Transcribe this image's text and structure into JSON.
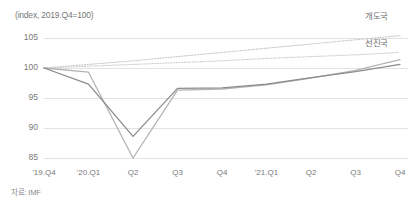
{
  "chart_data": {
    "type": "line",
    "title": "(index, 2019.Q4=100)",
    "xlabel": "",
    "ylabel": "",
    "unit_note": "(index, 2019.Q4=100)",
    "source": "자료: IMF",
    "grid": true,
    "legend_position": "right-inline",
    "ylim": [
      83,
      106.5
    ],
    "yticks": [
      85,
      90,
      95,
      100,
      105
    ],
    "ytick_labels": [
      "85",
      "90",
      "95",
      "100",
      "105"
    ],
    "categories": [
      "'19.Q4",
      "'20.Q1",
      "Q2",
      "Q3",
      "Q4",
      "'21.Q1",
      "Q2",
      "Q3",
      "Q4"
    ],
    "series": [
      {
        "name": "개도국",
        "label": "개도국",
        "style": "dotted",
        "color": "#c8c8c8",
        "values": [
          100.0,
          100.6,
          101.2,
          101.9,
          102.6,
          103.3,
          104.0,
          104.7,
          105.4
        ]
      },
      {
        "name": "선진국",
        "label": "선진국",
        "style": "dotted",
        "color": "#cfcfcf",
        "values": [
          100.0,
          100.3,
          100.6,
          100.9,
          101.2,
          101.6,
          101.9,
          102.2,
          102.6
        ]
      },
      {
        "name": "개도국 실적",
        "label": "",
        "style": "solid",
        "color": "#b4b4b4",
        "values": [
          100.0,
          99.3,
          85.0,
          96.3,
          96.5,
          97.2,
          98.3,
          99.6,
          101.4
        ]
      },
      {
        "name": "선진국 실적",
        "label": "",
        "style": "solid",
        "color": "#8c8c8c",
        "values": [
          100.0,
          97.3,
          88.6,
          96.6,
          96.7,
          97.3,
          98.4,
          99.4,
          100.6
        ]
      }
    ],
    "annotations": [
      {
        "text": "개도국",
        "target_series": "개도국",
        "position": "right"
      },
      {
        "text": "선진국",
        "target_series": "선진국",
        "position": "right"
      }
    ],
    "colors": {
      "grid": "#e3e3e3",
      "text": "#7a7a7a",
      "developing_projection": "#c8c8c8",
      "advanced_projection": "#cfcfcf",
      "developing_actual": "#b4b4b4",
      "advanced_actual": "#8c8c8c"
    }
  }
}
